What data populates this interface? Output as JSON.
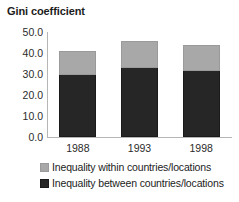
{
  "chart_data": {
    "type": "bar",
    "subtype": "stacked-vertical",
    "title": "Gini coefficient",
    "xlabel": "",
    "ylabel": "",
    "categories": [
      "1988",
      "1993",
      "1998"
    ],
    "series": [
      {
        "name": "Inequality between countries/locations",
        "color": "#262626",
        "values": [
          29.7,
          32.7,
          31.2
        ]
      },
      {
        "name": "Inequality within countries/locations",
        "color": "#a8a8a8",
        "values": [
          11.3,
          12.8,
          12.8
        ]
      }
    ],
    "totals": [
      41.0,
      45.5,
      44.0
    ],
    "ylim": [
      0.0,
      50.0
    ],
    "ytick_values": [
      50.0,
      40.0,
      30.0,
      20.0,
      10.0,
      0.0
    ],
    "ytick_labels": [
      "50.0",
      "40.0",
      "30.0",
      "20.0",
      "10.0",
      "0.0"
    ],
    "grid": false,
    "legend_position": "bottom",
    "legend_entries": [
      "Inequality within countries/locations",
      "Inequality between countries/locations"
    ]
  }
}
